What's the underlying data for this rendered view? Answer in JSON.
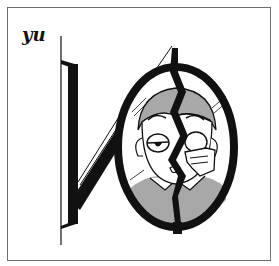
{
  "label": "yu",
  "illustration": {
    "subject": "cracked-mirror-with-tired-face",
    "colors": {
      "ink": "#111111",
      "gray_fill": "#a8a8a8",
      "paper": "#ffffff",
      "frame": "#6e6e6e"
    }
  }
}
